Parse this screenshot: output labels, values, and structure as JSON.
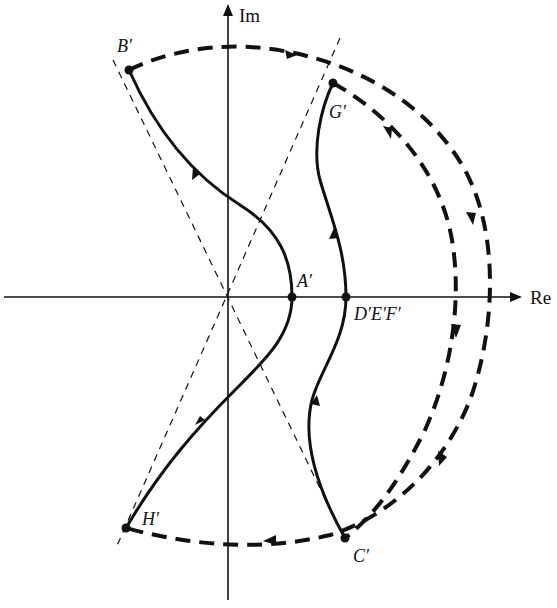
{
  "diagram": {
    "type": "nyquist-plot",
    "axes": {
      "imaginary_label": "Im",
      "real_label": "Re"
    },
    "points": [
      {
        "id": "B",
        "label": "B′"
      },
      {
        "id": "G",
        "label": "G′"
      },
      {
        "id": "A",
        "label": "A′"
      },
      {
        "id": "DEF",
        "label": "D′E′F′"
      },
      {
        "id": "H",
        "label": "H′"
      },
      {
        "id": "C",
        "label": "C′"
      }
    ],
    "colors": {
      "stroke": "#111111",
      "background": "#ffffff"
    }
  }
}
